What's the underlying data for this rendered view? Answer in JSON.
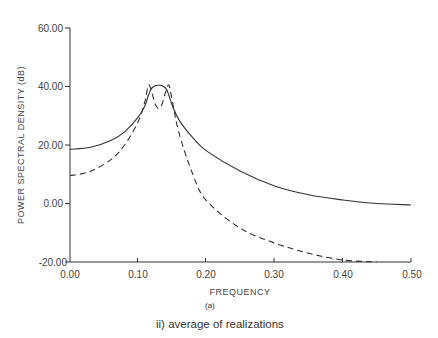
{
  "chart_data": {
    "type": "line",
    "title": "",
    "xlabel": "FREQUENCY",
    "ylabel": "POWER SPECTRAL DENSITY (dB)",
    "xlim": [
      0.0,
      0.5
    ],
    "ylim": [
      -20.0,
      60.0
    ],
    "x_ticks": [
      "0.00",
      "0.10",
      "0.20",
      "0.30",
      "0.40",
      "0.50"
    ],
    "y_ticks": [
      "-20.00",
      "0.00",
      "20.00",
      "40.00",
      "60.00"
    ],
    "grid": false,
    "legend": null,
    "sub_caption": "(a)",
    "caption": "ii) average of realizations",
    "series": [
      {
        "name": "solid",
        "style": "solid",
        "x": [
          0.0,
          0.03,
          0.06,
          0.08,
          0.1,
          0.11,
          0.115,
          0.12,
          0.13,
          0.14,
          0.145,
          0.15,
          0.16,
          0.18,
          0.2,
          0.25,
          0.3,
          0.35,
          0.4,
          0.45,
          0.5
        ],
        "y": [
          18.5,
          19.2,
          21.5,
          24.5,
          29.5,
          33.5,
          37.0,
          39.5,
          40.5,
          39.5,
          37.0,
          33.5,
          28.5,
          22.5,
          18.0,
          11.0,
          6.0,
          3.0,
          1.2,
          0.0,
          -0.5
        ]
      },
      {
        "name": "dashed",
        "style": "dashed",
        "x": [
          0.0,
          0.03,
          0.06,
          0.08,
          0.1,
          0.11,
          0.115,
          0.12,
          0.125,
          0.13,
          0.135,
          0.14,
          0.145,
          0.15,
          0.16,
          0.18,
          0.2,
          0.25,
          0.3,
          0.35,
          0.4,
          0.45
        ],
        "y": [
          9.5,
          11.0,
          15.0,
          20.0,
          28.0,
          35.0,
          40.5,
          38.0,
          34.0,
          32.5,
          34.0,
          38.0,
          40.5,
          35.0,
          24.0,
          10.0,
          1.0,
          -8.5,
          -13.5,
          -17.0,
          -19.3,
          -20.0
        ]
      }
    ]
  }
}
